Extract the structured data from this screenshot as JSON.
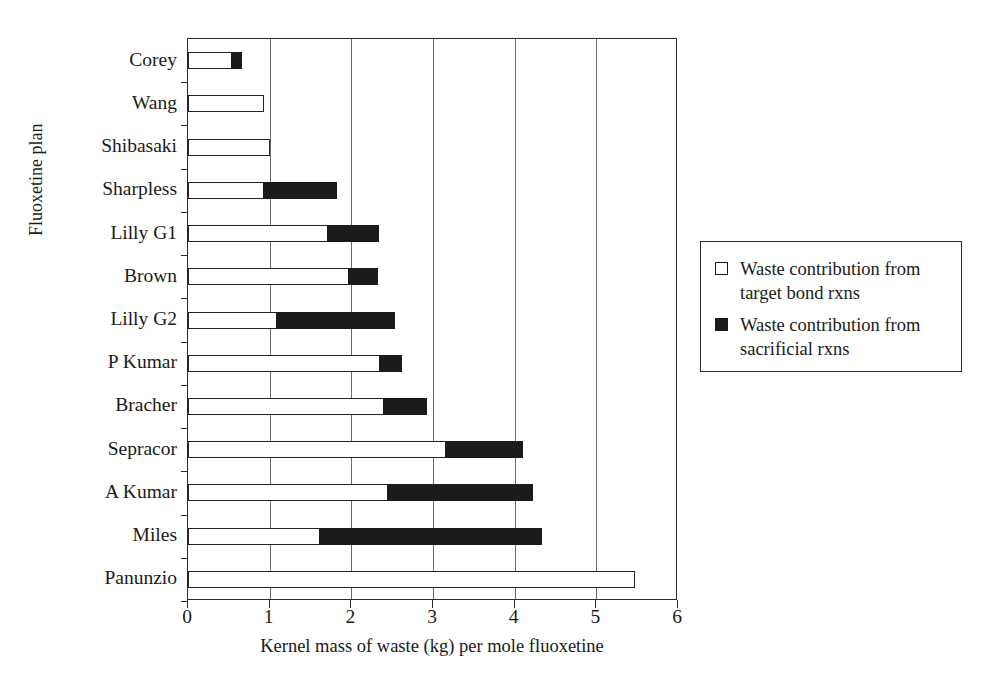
{
  "chart_data": {
    "type": "bar",
    "orientation": "horizontal",
    "stacked": true,
    "title": "",
    "xlabel": "Kernel mass of waste (kg) per mole fluoxetine",
    "ylabel": "Fluoxetine plan",
    "xlim": [
      0,
      6
    ],
    "xticks": [
      0,
      1,
      2,
      3,
      4,
      5,
      6
    ],
    "xtick_labels": [
      "0",
      "1",
      "2",
      "3",
      "4",
      "5",
      "6"
    ],
    "grid": "vertical",
    "legend_position": "right",
    "categories": [
      "Corey",
      "Wang",
      "Shibasaki",
      "Sharpless",
      "Lilly G1",
      "Brown",
      "Lilly G2",
      "P Kumar",
      "Bracher",
      "Sepracor",
      "A Kumar",
      "Miles",
      "Panunzio"
    ],
    "series": [
      {
        "name": "Waste contribution from target bond rxns",
        "color": "#ffffff",
        "values": [
          0.54,
          0.93,
          1.01,
          0.94,
          1.72,
          1.98,
          1.1,
          2.36,
          2.4,
          3.16,
          2.45,
          1.62,
          5.47
        ]
      },
      {
        "name": "Waste contribution from sacrificial rxns",
        "color": "#1b1b1b",
        "values": [
          0.12,
          0.0,
          0.0,
          0.89,
          0.62,
          0.35,
          1.44,
          0.26,
          0.53,
          0.94,
          1.77,
          2.71,
          0.0
        ]
      }
    ],
    "totals": [
      0.66,
      0.93,
      1.01,
      1.83,
      2.34,
      2.33,
      2.54,
      2.62,
      2.93,
      4.1,
      4.22,
      4.33,
      5.47
    ]
  },
  "legend": {
    "entries": [
      {
        "swatch": "open",
        "label": "Waste contribution from target bond rxns"
      },
      {
        "swatch": "solid",
        "label": "Waste contribution from sacrificial rxns"
      }
    ]
  }
}
